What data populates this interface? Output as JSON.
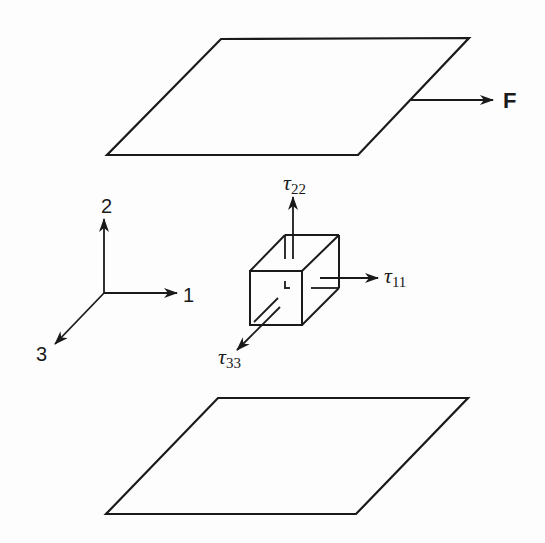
{
  "diagram": {
    "force_label": "F",
    "axes": {
      "x1": "1",
      "x2": "2",
      "x3": "3"
    },
    "stresses": {
      "t11": {
        "symbol": "τ",
        "sub": "11"
      },
      "t22": {
        "symbol": "τ",
        "sub": "22"
      },
      "t33": {
        "symbol": "τ",
        "sub": "33"
      }
    },
    "elements": [
      "top-plate",
      "bottom-plate",
      "fluid-element-cube",
      "coordinate-axes",
      "force-arrow"
    ],
    "line_color": "#1a1a1a",
    "background": "#fdfdfd"
  }
}
